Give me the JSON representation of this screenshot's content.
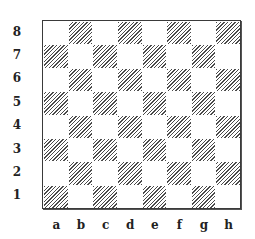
{
  "board": {
    "size": 8,
    "ranks": [
      "8",
      "7",
      "6",
      "5",
      "4",
      "3",
      "2",
      "1"
    ],
    "files": [
      "a",
      "b",
      "c",
      "d",
      "e",
      "f",
      "g",
      "h"
    ],
    "top_left_square_color": "light",
    "light_color": "#ffffff",
    "dark_pattern": "diagonal-hatch",
    "dark_hatch_color": "#4a4a4a",
    "border_color": "#3a3a3a"
  }
}
